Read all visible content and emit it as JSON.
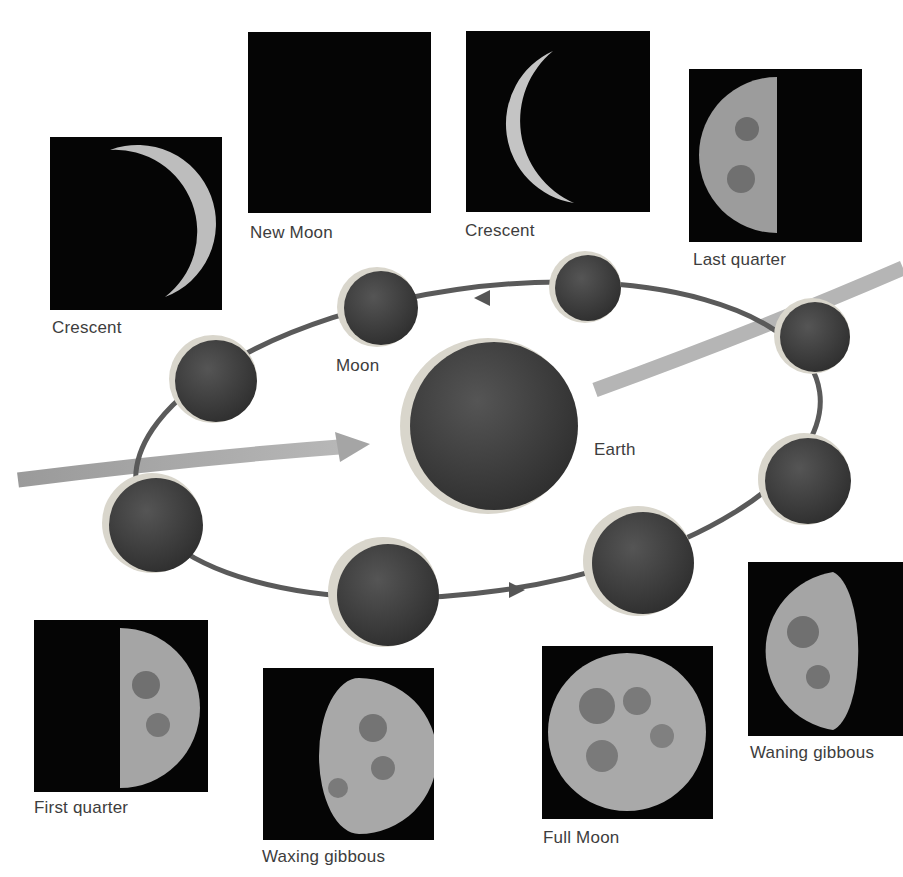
{
  "diagram": {
    "center_label": "Earth",
    "orbit_body_label": "Moon",
    "colors": {
      "background": "#ffffff",
      "photo_bg": "#050505",
      "sphere_dark": "#3f3f3f",
      "sphere_lit": "#d8d6cf",
      "orbit_line": "#5c5c5c",
      "sunlight_band": "#a8a8a8",
      "label_text": "#3d3d3d"
    }
  },
  "phases": [
    {
      "id": "crescent-waxing",
      "label": "Crescent"
    },
    {
      "id": "new-moon",
      "label": "New Moon"
    },
    {
      "id": "crescent-waning",
      "label": "Crescent"
    },
    {
      "id": "last-quarter",
      "label": "Last quarter"
    },
    {
      "id": "waning-gibbous",
      "label": "Waning gibbous"
    },
    {
      "id": "full-moon",
      "label": "Full Moon"
    },
    {
      "id": "waxing-gibbous",
      "label": "Waxing gibbous"
    },
    {
      "id": "first-quarter",
      "label": "First quarter"
    }
  ]
}
